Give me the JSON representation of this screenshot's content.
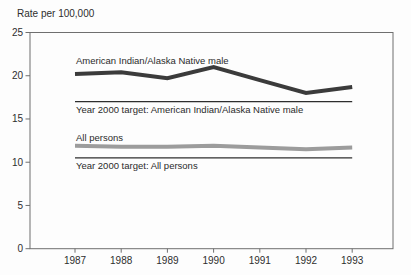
{
  "title": "Rate per 100,000",
  "chart_data": {
    "type": "line",
    "title": "Rate per 100,000",
    "xlabel": "",
    "ylabel": "Rate per 100,000",
    "x": [
      1987,
      1988,
      1989,
      1990,
      1991,
      1992,
      1993
    ],
    "x_tick_labels": [
      "1987",
      "1988",
      "1989",
      "1990",
      "1991",
      "1992",
      "1993"
    ],
    "ylim": [
      0,
      25
    ],
    "yticks": [
      0,
      5,
      10,
      15,
      20,
      25
    ],
    "grid": false,
    "legend_position": "inline-annotations",
    "series": [
      {
        "name": "American Indian/Alaska Native male",
        "role": "data-line",
        "color": "#3b3b3b",
        "stroke_width": 4,
        "values": [
          20.2,
          20.4,
          19.7,
          21.0,
          19.5,
          18.0,
          18.7
        ]
      },
      {
        "name": "Year 2000 target: American Indian/Alaska Native male",
        "role": "target-line",
        "color": "#2e2e2e",
        "stroke_width": 1.3,
        "target_value": 17,
        "values": [
          17,
          17,
          17,
          17,
          17,
          17,
          17
        ]
      },
      {
        "name": "All persons",
        "role": "data-line",
        "color": "#9c9c9c",
        "stroke_width": 4,
        "values": [
          11.9,
          11.8,
          11.8,
          11.9,
          11.7,
          11.5,
          11.7
        ]
      },
      {
        "name": "Year 2000 target: All persons",
        "role": "target-line",
        "color": "#2e2e2e",
        "stroke_width": 1.3,
        "target_value": 10.5,
        "values": [
          10.5,
          10.5,
          10.5,
          10.5,
          10.5,
          10.5,
          10.5
        ]
      }
    ],
    "colors": {
      "axis": "#6f6f6f",
      "tick_text": "#2e2e2e",
      "background": "#fdfdfd"
    }
  }
}
